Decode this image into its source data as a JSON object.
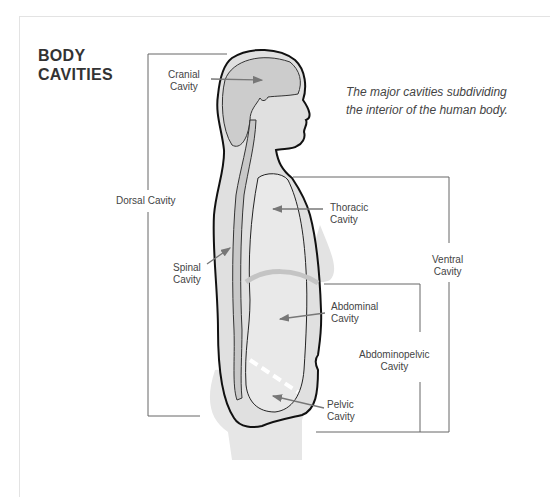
{
  "figure": {
    "title_line1": "BODY",
    "title_line2": "CAVITIES",
    "subtitle_line1": "The major cavities subdividing",
    "subtitle_line2": "the interior of the human body."
  },
  "labels": {
    "cranial": [
      "Cranial",
      "Cavity"
    ],
    "dorsal": "Dorsal Cavity",
    "thoracic": [
      "Thoracic",
      "Cavity"
    ],
    "spinal": [
      "Spinal",
      "Cavity"
    ],
    "ventral": [
      "Ventral",
      "Cavity"
    ],
    "abdominal": [
      "Abdominal",
      "Cavity"
    ],
    "abdominopelvic": [
      "Abdominopelvic",
      "Cavity"
    ],
    "pelvic": [
      "Pelvic",
      "Cavity"
    ]
  },
  "colors": {
    "body_fill": "#e2e2e2",
    "cavity_fill": "#cfcfcf",
    "outline": "#111111",
    "bracket": "#666666",
    "arrow": "#777777"
  }
}
